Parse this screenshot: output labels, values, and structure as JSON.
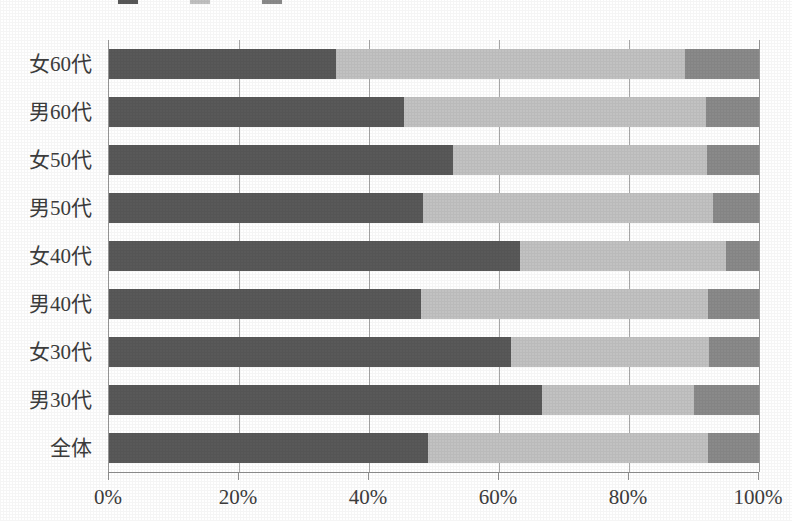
{
  "chart_data": {
    "type": "bar",
    "orientation": "horizontal",
    "stacked": true,
    "stacked_mode": "percent",
    "title": "",
    "xlabel": "",
    "ylabel": "",
    "xlim": [
      0,
      100
    ],
    "grid": true,
    "legend_position": "top",
    "xtick_labels": [
      "0%",
      "20%",
      "40%",
      "60%",
      "80%",
      "100%"
    ],
    "xtick_values": [
      0,
      20,
      40,
      60,
      80,
      100
    ],
    "categories": [
      "女60代",
      "男60代",
      "女50代",
      "男50代",
      "女40代",
      "男40代",
      "女30代",
      "男30代",
      "全体"
    ],
    "series": [
      {
        "name": "series-1",
        "color": "#595959",
        "values": [
          34.9,
          45.4,
          52.9,
          48.3,
          63.2,
          48.0,
          61.8,
          66.6,
          49.1
        ]
      },
      {
        "name": "series-2",
        "color": "#c2c2c2",
        "values": [
          53.7,
          46.4,
          39.1,
          44.6,
          31.7,
          44.2,
          30.5,
          23.4,
          43.0
        ]
      },
      {
        "name": "series-3",
        "color": "#8a8a8a",
        "values": [
          11.4,
          8.2,
          8.0,
          7.1,
          5.1,
          7.8,
          7.7,
          10.0,
          7.9
        ]
      }
    ]
  },
  "legend": {
    "entries": [
      {
        "label": "",
        "color": "#595959"
      },
      {
        "label": "",
        "color": "#c2c2c2"
      },
      {
        "label": "",
        "color": "#8a8a8a"
      }
    ]
  },
  "colors": {
    "segment_dark": "#595959",
    "segment_light": "#c2c2c2",
    "segment_medium": "#8a8a8a",
    "axis": "#8f8f8f",
    "gridline": "#a8a8a8",
    "text": "#3d3d3d",
    "background": "#ffffff"
  }
}
